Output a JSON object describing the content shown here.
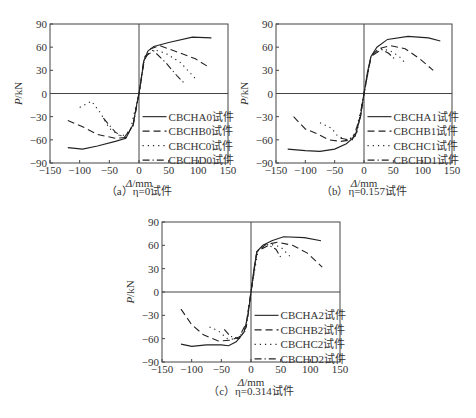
{
  "chart_data": [
    {
      "type": "line",
      "panel": "a",
      "caption": "（a）η=0试件",
      "xlabel": "Δ/mm",
      "ylabel": "P/kN",
      "xlim": [
        -150,
        150
      ],
      "ylim": [
        -90,
        90
      ],
      "xticks": [
        -150,
        -100,
        -50,
        0,
        50,
        100,
        150
      ],
      "yticks": [
        -90,
        -60,
        -30,
        0,
        30,
        60,
        90
      ],
      "legend_position": "lower right",
      "series": [
        {
          "name": "CBCHA0试件",
          "style": "solid",
          "points": [
            [
              -120,
              -70
            ],
            [
              -95,
              -72
            ],
            [
              -70,
              -68
            ],
            [
              -40,
              -62
            ],
            [
              -22,
              -58
            ],
            [
              -10,
              -40
            ],
            [
              -4,
              -15
            ],
            [
              0,
              0
            ],
            [
              4,
              20
            ],
            [
              8,
              42
            ],
            [
              15,
              55
            ],
            [
              25,
              61
            ],
            [
              50,
              66
            ],
            [
              90,
              73
            ],
            [
              122,
              72
            ]
          ]
        },
        {
          "name": "CBCHB0试件",
          "style": "dash",
          "points": [
            [
              -120,
              -35
            ],
            [
              -95,
              -43
            ],
            [
              -70,
              -53
            ],
            [
              -40,
              -58
            ],
            [
              -22,
              -57
            ],
            [
              -10,
              -40
            ],
            [
              0,
              0
            ],
            [
              8,
              42
            ],
            [
              20,
              58
            ],
            [
              35,
              62
            ],
            [
              60,
              55
            ],
            [
              95,
              45
            ],
            [
              120,
              33
            ]
          ]
        },
        {
          "name": "CBCHC0试件",
          "style": "dot",
          "points": [
            [
              -100,
              -18
            ],
            [
              -80,
              -10
            ],
            [
              -65,
              -25
            ],
            [
              -50,
              -45
            ],
            [
              -30,
              -56
            ],
            [
              -15,
              -48
            ],
            [
              0,
              0
            ],
            [
              10,
              48
            ],
            [
              25,
              57
            ],
            [
              45,
              52
            ],
            [
              70,
              40
            ],
            [
              98,
              17
            ]
          ]
        },
        {
          "name": "CBCHD0试件",
          "style": "dashdot",
          "points": [
            [
              -60,
              -32
            ],
            [
              -40,
              -50
            ],
            [
              -25,
              -57
            ],
            [
              -10,
              -42
            ],
            [
              0,
              0
            ],
            [
              10,
              48
            ],
            [
              25,
              55
            ],
            [
              45,
              40
            ],
            [
              65,
              22
            ],
            [
              78,
              12
            ]
          ]
        }
      ]
    },
    {
      "type": "line",
      "panel": "b",
      "caption": "（b）η=0.157试件",
      "xlabel": "Δ/mm",
      "ylabel": "P/kN",
      "xlim": [
        -150,
        150
      ],
      "ylim": [
        -90,
        90
      ],
      "xticks": [
        -150,
        -100,
        -50,
        0,
        50,
        100,
        150
      ],
      "yticks": [
        -90,
        -60,
        -30,
        0,
        30,
        60,
        90
      ],
      "legend_position": "lower right",
      "series": [
        {
          "name": "CBCHA1试件",
          "style": "solid",
          "points": [
            [
              -130,
              -72
            ],
            [
              -100,
              -74
            ],
            [
              -75,
              -75
            ],
            [
              -50,
              -72
            ],
            [
              -30,
              -65
            ],
            [
              -15,
              -55
            ],
            [
              -6,
              -30
            ],
            [
              0,
              0
            ],
            [
              6,
              28
            ],
            [
              12,
              48
            ],
            [
              22,
              60
            ],
            [
              40,
              70
            ],
            [
              75,
              74
            ],
            [
              110,
              72
            ],
            [
              130,
              68
            ]
          ]
        },
        {
          "name": "CBCHB1试件",
          "style": "dash",
          "points": [
            [
              -120,
              -30
            ],
            [
              -100,
              -46
            ],
            [
              -80,
              -52
            ],
            [
              -60,
              -60
            ],
            [
              -40,
              -62
            ],
            [
              -20,
              -60
            ],
            [
              -6,
              -30
            ],
            [
              0,
              0
            ],
            [
              12,
              48
            ],
            [
              25,
              58
            ],
            [
              45,
              62
            ],
            [
              70,
              58
            ],
            [
              95,
              45
            ],
            [
              118,
              30
            ]
          ]
        },
        {
          "name": "CBCHC1试件",
          "style": "dot",
          "points": [
            [
              -75,
              -38
            ],
            [
              -55,
              -45
            ],
            [
              -45,
              -55
            ],
            [
              -30,
              -60
            ],
            [
              -15,
              -55
            ],
            [
              0,
              0
            ],
            [
              12,
              48
            ],
            [
              30,
              58
            ],
            [
              45,
              55
            ],
            [
              60,
              48
            ],
            [
              72,
              38
            ]
          ]
        },
        {
          "name": "CBCHD1试件",
          "style": "dashdot",
          "points": [
            [
              -40,
              -58
            ],
            [
              -25,
              -60
            ],
            [
              -12,
              -50
            ],
            [
              0,
              0
            ],
            [
              12,
              48
            ],
            [
              30,
              57
            ],
            [
              42,
              52
            ],
            [
              52,
              45
            ]
          ]
        }
      ]
    },
    {
      "type": "line",
      "panel": "c",
      "caption": "（c）η=0.314试件",
      "xlabel": "Δ/mm",
      "ylabel": "P/kN",
      "xlim": [
        -150,
        150
      ],
      "ylim": [
        -90,
        90
      ],
      "xticks": [
        -150,
        -100,
        -50,
        0,
        50,
        100,
        150
      ],
      "yticks": [
        -90,
        -60,
        -30,
        0,
        30,
        60,
        90
      ],
      "legend_position": "lower right",
      "series": [
        {
          "name": "CBCHA2试件",
          "style": "solid",
          "points": [
            [
              -118,
              -67
            ],
            [
              -100,
              -70
            ],
            [
              -75,
              -68
            ],
            [
              -50,
              -68
            ],
            [
              -38,
              -69
            ],
            [
              -25,
              -64
            ],
            [
              -12,
              -52
            ],
            [
              -5,
              -30
            ],
            [
              0,
              0
            ],
            [
              5,
              30
            ],
            [
              10,
              52
            ],
            [
              20,
              60
            ],
            [
              35,
              66
            ],
            [
              55,
              71
            ],
            [
              90,
              70
            ],
            [
              118,
              66
            ]
          ]
        },
        {
          "name": "CBCHB2试件",
          "style": "dash",
          "points": [
            [
              -118,
              -22
            ],
            [
              -100,
              -42
            ],
            [
              -80,
              -55
            ],
            [
              -55,
              -63
            ],
            [
              -35,
              -62
            ],
            [
              -20,
              -58
            ],
            [
              -8,
              -40
            ],
            [
              0,
              0
            ],
            [
              10,
              52
            ],
            [
              25,
              61
            ],
            [
              45,
              64
            ],
            [
              70,
              60
            ],
            [
              95,
              50
            ],
            [
              120,
              32
            ]
          ]
        },
        {
          "name": "CBCHC2试件",
          "style": "dot",
          "points": [
            [
              -70,
              -45
            ],
            [
              -55,
              -50
            ],
            [
              -40,
              -60
            ],
            [
              -25,
              -61
            ],
            [
              -10,
              -50
            ],
            [
              0,
              0
            ],
            [
              12,
              54
            ],
            [
              30,
              62
            ],
            [
              50,
              58
            ],
            [
              68,
              44
            ]
          ]
        },
        {
          "name": "CBCHD2试件",
          "style": "dashdot",
          "points": [
            [
              -45,
              -48
            ],
            [
              -35,
              -57
            ],
            [
              -20,
              -60
            ],
            [
              -8,
              -45
            ],
            [
              0,
              0
            ],
            [
              10,
              52
            ],
            [
              30,
              60
            ],
            [
              42,
              55
            ],
            [
              52,
              42
            ]
          ]
        }
      ]
    }
  ],
  "panels": {
    "a": {
      "caption": "（a）η=0试件",
      "legend": [
        "CBCHA0试件",
        "CBCHB0试件",
        "CBCHC0试件",
        "CBCHD0试件"
      ]
    },
    "b": {
      "caption": "（b）η=0.157试件",
      "legend": [
        "CBCHA1试件",
        "CBCHB1试件",
        "CBCHC1试件",
        "CBCHD1试件"
      ]
    },
    "c": {
      "caption": "（c）η=0.314试件",
      "legend": [
        "CBCHA2试件",
        "CBCHB2试件",
        "CBCHC2试件",
        "CBCHD2试件"
      ]
    }
  },
  "axes": {
    "xlabel": "Δ/mm",
    "ylabel": "P/kN"
  }
}
